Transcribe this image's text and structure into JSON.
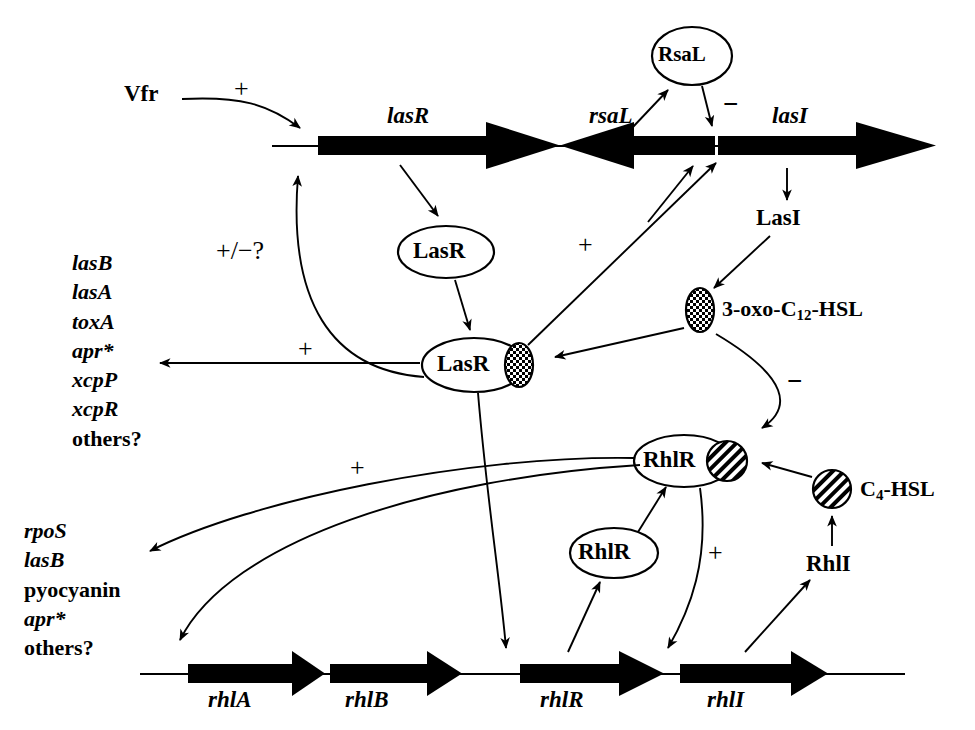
{
  "diagram": {
    "colors": {
      "ink": "#000000",
      "background": "#ffffff"
    }
  },
  "operons": {
    "top": {
      "name": "las-operon-row",
      "genes": [
        {
          "label": "lasR",
          "direction": "right"
        },
        {
          "label": "rsaL",
          "direction": "left"
        },
        {
          "label": "lasI",
          "direction": "right"
        }
      ]
    },
    "bottom": {
      "name": "rhl-operon-row",
      "genes": [
        {
          "label": "rhlA",
          "direction": "right"
        },
        {
          "label": "rhlB",
          "direction": "right"
        },
        {
          "label": "rhlR",
          "direction": "right"
        },
        {
          "label": "rhlI",
          "direction": "right"
        }
      ]
    }
  },
  "nodes": {
    "vfr": "Vfr",
    "rsal_protein": "RsaL",
    "lasr_protein": "LasR",
    "lasr_complex": "LasR",
    "lasi_protein": "LasI",
    "rhlr_protein": "RhlR",
    "rhlr_complex": "RhlR",
    "rhli_protein": "RhlI",
    "autoinducer_long": "3-oxo-C",
    "autoinducer_long_sub": "12",
    "autoinducer_long_tail": "-HSL",
    "autoinducer_short": "C",
    "autoinducer_short_sub": "4",
    "autoinducer_short_tail": "-HSL"
  },
  "signs": {
    "vfr_to_lasr": "+",
    "feedback_plus_minus": "+/−?",
    "lasr_complex_to_targets": "+",
    "lasr_complex_to_operon": "+",
    "rsal_to_lasi": "−",
    "hsl_to_rhlr_inhibit": "−",
    "lasr_complex_to_rhl_targets": "+",
    "lasr_complex_to_rhlr_gene": "+",
    "rhlr_complex_to_rhli": "+"
  },
  "target_lists": {
    "las_targets": {
      "name": "las-regulated-genes",
      "items": [
        {
          "text": "lasB",
          "italic": true
        },
        {
          "text": "lasA",
          "italic": true
        },
        {
          "text": "toxA",
          "italic": true
        },
        {
          "text": "apr*",
          "italic": true
        },
        {
          "text": "xcpP",
          "italic": true
        },
        {
          "text": "xcpR",
          "italic": true
        },
        {
          "text": "others?",
          "italic": false
        }
      ]
    },
    "rhl_targets": {
      "name": "rhl-regulated-genes",
      "items": [
        {
          "text": "rpoS",
          "italic": true
        },
        {
          "text": "lasB",
          "italic": true
        },
        {
          "text": "pyocyanin",
          "italic": false
        },
        {
          "text": "apr*",
          "italic": true
        },
        {
          "text": "others?",
          "italic": false
        }
      ]
    }
  }
}
